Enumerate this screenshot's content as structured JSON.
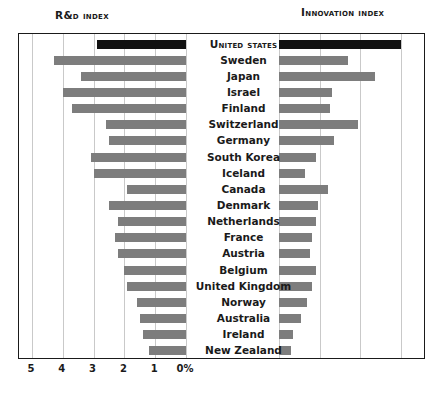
{
  "figure": {
    "left_title": "R&D Index",
    "right_title": "Innovation Index"
  },
  "chart_data": {
    "type": "bar",
    "orientation": "horizontal",
    "layout": "back-to-back dual panel, shared country axis in center",
    "grid": true,
    "legend": null,
    "highlight_category": "United States",
    "highlight_color": "#111111",
    "bar_color": "#7d7d7d",
    "categories": [
      "United States",
      "Sweden",
      "Japan",
      "Israel",
      "Finland",
      "Switzerland",
      "Germany",
      "South Korea",
      "Iceland",
      "Canada",
      "Denmark",
      "Netherlands",
      "France",
      "Austria",
      "Belgium",
      "United Kingdom",
      "Norway",
      "Australia",
      "Ireland",
      "New Zealand"
    ],
    "panels": [
      {
        "name": "R&D Index",
        "position": "left",
        "xlabel": "",
        "ylabel": "",
        "unit": "%",
        "axis_direction": "reversed",
        "xlim": [
          5,
          0
        ],
        "ticks": [
          "5",
          "4",
          "3",
          "2",
          "1",
          "0%"
        ],
        "tick_values": [
          5,
          4,
          3,
          2,
          1,
          0
        ],
        "values": [
          2.9,
          4.3,
          3.4,
          4.0,
          3.7,
          2.6,
          2.5,
          3.1,
          3.0,
          1.9,
          2.5,
          2.2,
          2.3,
          2.2,
          2.0,
          1.9,
          1.6,
          1.5,
          1.4,
          1.2
        ]
      },
      {
        "name": "Innovation Index",
        "position": "right",
        "xlabel": "",
        "ylabel": "",
        "unit": "",
        "axis_direction": "normal",
        "xlim": [
          0,
          300
        ],
        "ticks": [
          "0",
          "100",
          "200",
          "300"
        ],
        "tick_values": [
          0,
          100,
          200,
          300
        ],
        "values": [
          300,
          170,
          235,
          130,
          125,
          195,
          135,
          90,
          65,
          120,
          95,
          90,
          80,
          75,
          90,
          80,
          70,
          55,
          35,
          30
        ]
      }
    ]
  }
}
